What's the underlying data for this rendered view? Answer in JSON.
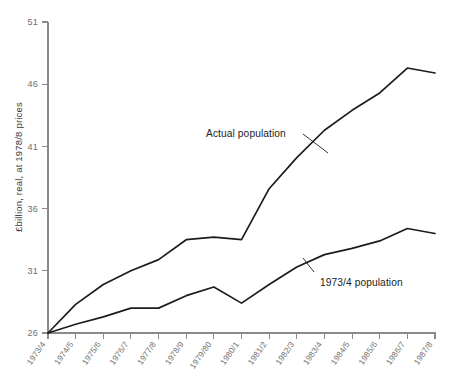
{
  "chart_data": {
    "type": "line",
    "title": "",
    "xlabel": "",
    "ylabel": "£billion, real, at 1978/8 prices",
    "ylim": [
      26,
      51
    ],
    "yticks": [
      26,
      31,
      36,
      41,
      46,
      51
    ],
    "grid": false,
    "legend_position": "inline-annotations",
    "categories": [
      "1973/4",
      "1974/5",
      "1975/6",
      "1976/7",
      "1977/8",
      "1978/9",
      "1979/80",
      "1980/1",
      "1981/2",
      "1982/3",
      "1983/4",
      "1984/5",
      "1985/6",
      "1986/7",
      "1987/8"
    ],
    "series": [
      {
        "name": "Actual population",
        "values": [
          26.0,
          28.3,
          29.9,
          31.0,
          31.9,
          33.5,
          33.7,
          33.5,
          37.6,
          40.1,
          42.3,
          43.9,
          45.3,
          47.3,
          46.9
        ]
      },
      {
        "name": "1973/4 population",
        "values": [
          26.0,
          26.7,
          27.3,
          28.0,
          28.0,
          29.0,
          29.7,
          28.4,
          29.9,
          31.3,
          32.3,
          32.8,
          33.4,
          34.4,
          34.0
        ]
      }
    ],
    "annotations": [
      {
        "text": "Actual population",
        "series": "Actual population"
      },
      {
        "text": "1973/4 population",
        "series": "1973/4 population"
      }
    ]
  },
  "colors": {
    "line": "#1c1c1c",
    "axis": "#8a8a8a",
    "tick_label": "#6e6e6e",
    "background": "#ffffff"
  }
}
